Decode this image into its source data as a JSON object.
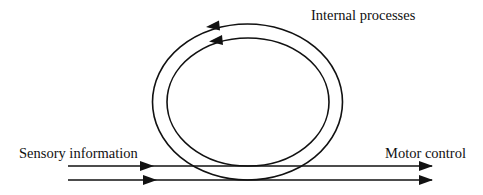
{
  "diagram": {
    "type": "flow-loop",
    "labels": {
      "internal": "Internal processes",
      "sensory": "Sensory information",
      "motor": "Motor control"
    },
    "nodes": [
      {
        "id": "sensory",
        "label": "Sensory information",
        "role": "input"
      },
      {
        "id": "internal",
        "label": "Internal processes",
        "role": "loop"
      },
      {
        "id": "motor",
        "label": "Motor control",
        "role": "output"
      }
    ],
    "edges": [
      {
        "from": "sensory",
        "to": "motor",
        "style": "double-parallel-arrow",
        "direction": "left-to-right"
      },
      {
        "from": "internal",
        "to": "internal",
        "style": "double-concentric-loop",
        "direction": "counter-clockwise"
      }
    ],
    "colors": {
      "stroke": "#111111",
      "background": "#ffffff",
      "text": "#111111"
    }
  }
}
